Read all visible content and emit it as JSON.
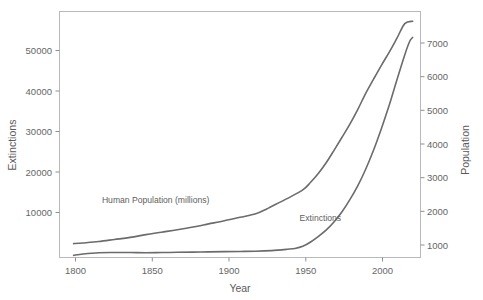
{
  "chart_data": {
    "type": "line",
    "title": "",
    "subtitle": "",
    "xlabel": "Year",
    "ylabel": "Extinctions",
    "y2label": "Population",
    "xlim": [
      1795,
      2025
    ],
    "ylim": [
      0,
      57000
    ],
    "y2lim": [
      600,
      7700
    ],
    "grid": false,
    "legend_position": "inline-annotations",
    "xticks": [
      1800,
      1850,
      1900,
      1950,
      2000
    ],
    "xtick_labels": [
      "1800",
      "1850",
      "1900",
      "1950",
      "2000"
    ],
    "yticks": [
      10000,
      20000,
      30000,
      40000,
      50000
    ],
    "ytick_labels": [
      "10000",
      "20000",
      "30000",
      "40000",
      "50000"
    ],
    "y2ticks": [
      1000,
      2000,
      3000,
      4000,
      5000,
      6000,
      7000
    ],
    "y2tick_labels": [
      "1000",
      "2000",
      "3000",
      "4000",
      "5000",
      "6000",
      "7000"
    ],
    "annotations": [
      {
        "text": "Human Population (millions)",
        "x": 1822,
        "y": 12600,
        "axis": "left"
      },
      {
        "text": "Extinctions",
        "x": 1948,
        "y": 8500,
        "axis": "left"
      }
    ],
    "series": [
      {
        "name": "Human Population (millions)",
        "axis": "right",
        "units": "millions",
        "color": "#6b6b6b",
        "x": [
          1804,
          1810,
          1820,
          1830,
          1840,
          1850,
          1860,
          1870,
          1880,
          1890,
          1900,
          1910,
          1920,
          1927,
          1930,
          1940,
          1950,
          1955,
          1960,
          1965,
          1970,
          1975,
          1980,
          1985,
          1990,
          1995,
          2000,
          2005,
          2010,
          2015,
          2020
        ],
        "values": [
          1000,
          1020,
          1060,
          1120,
          1180,
          1260,
          1330,
          1400,
          1480,
          1570,
          1660,
          1760,
          1860,
          2000,
          2070,
          2300,
          2550,
          2770,
          3030,
          3340,
          3700,
          4070,
          4450,
          4870,
          5330,
          5740,
          6140,
          6520,
          6930,
          7350,
          7420
        ]
      },
      {
        "name": "Extinctions",
        "axis": "left",
        "units": "cumulative extinctions",
        "color": "#6b6b6b",
        "x": [
          1804,
          1810,
          1820,
          1830,
          1840,
          1850,
          1860,
          1870,
          1880,
          1890,
          1900,
          1910,
          1920,
          1930,
          1940,
          1945,
          1950,
          1955,
          1960,
          1965,
          1970,
          1975,
          1980,
          1985,
          1990,
          1995,
          2000,
          2005,
          2010,
          2015,
          2018,
          2020
        ],
        "values": [
          500,
          800,
          1100,
          1150,
          1150,
          1100,
          1150,
          1200,
          1250,
          1300,
          1350,
          1400,
          1450,
          1600,
          1900,
          2100,
          2600,
          3600,
          4900,
          6400,
          8300,
          10600,
          13400,
          16600,
          20400,
          24800,
          29800,
          35200,
          41200,
          47000,
          50000,
          51000
        ]
      }
    ]
  },
  "axes": {
    "left": {
      "title": "Extinctions"
    },
    "right": {
      "title": "Population"
    },
    "bottom": {
      "title": "Year"
    }
  }
}
